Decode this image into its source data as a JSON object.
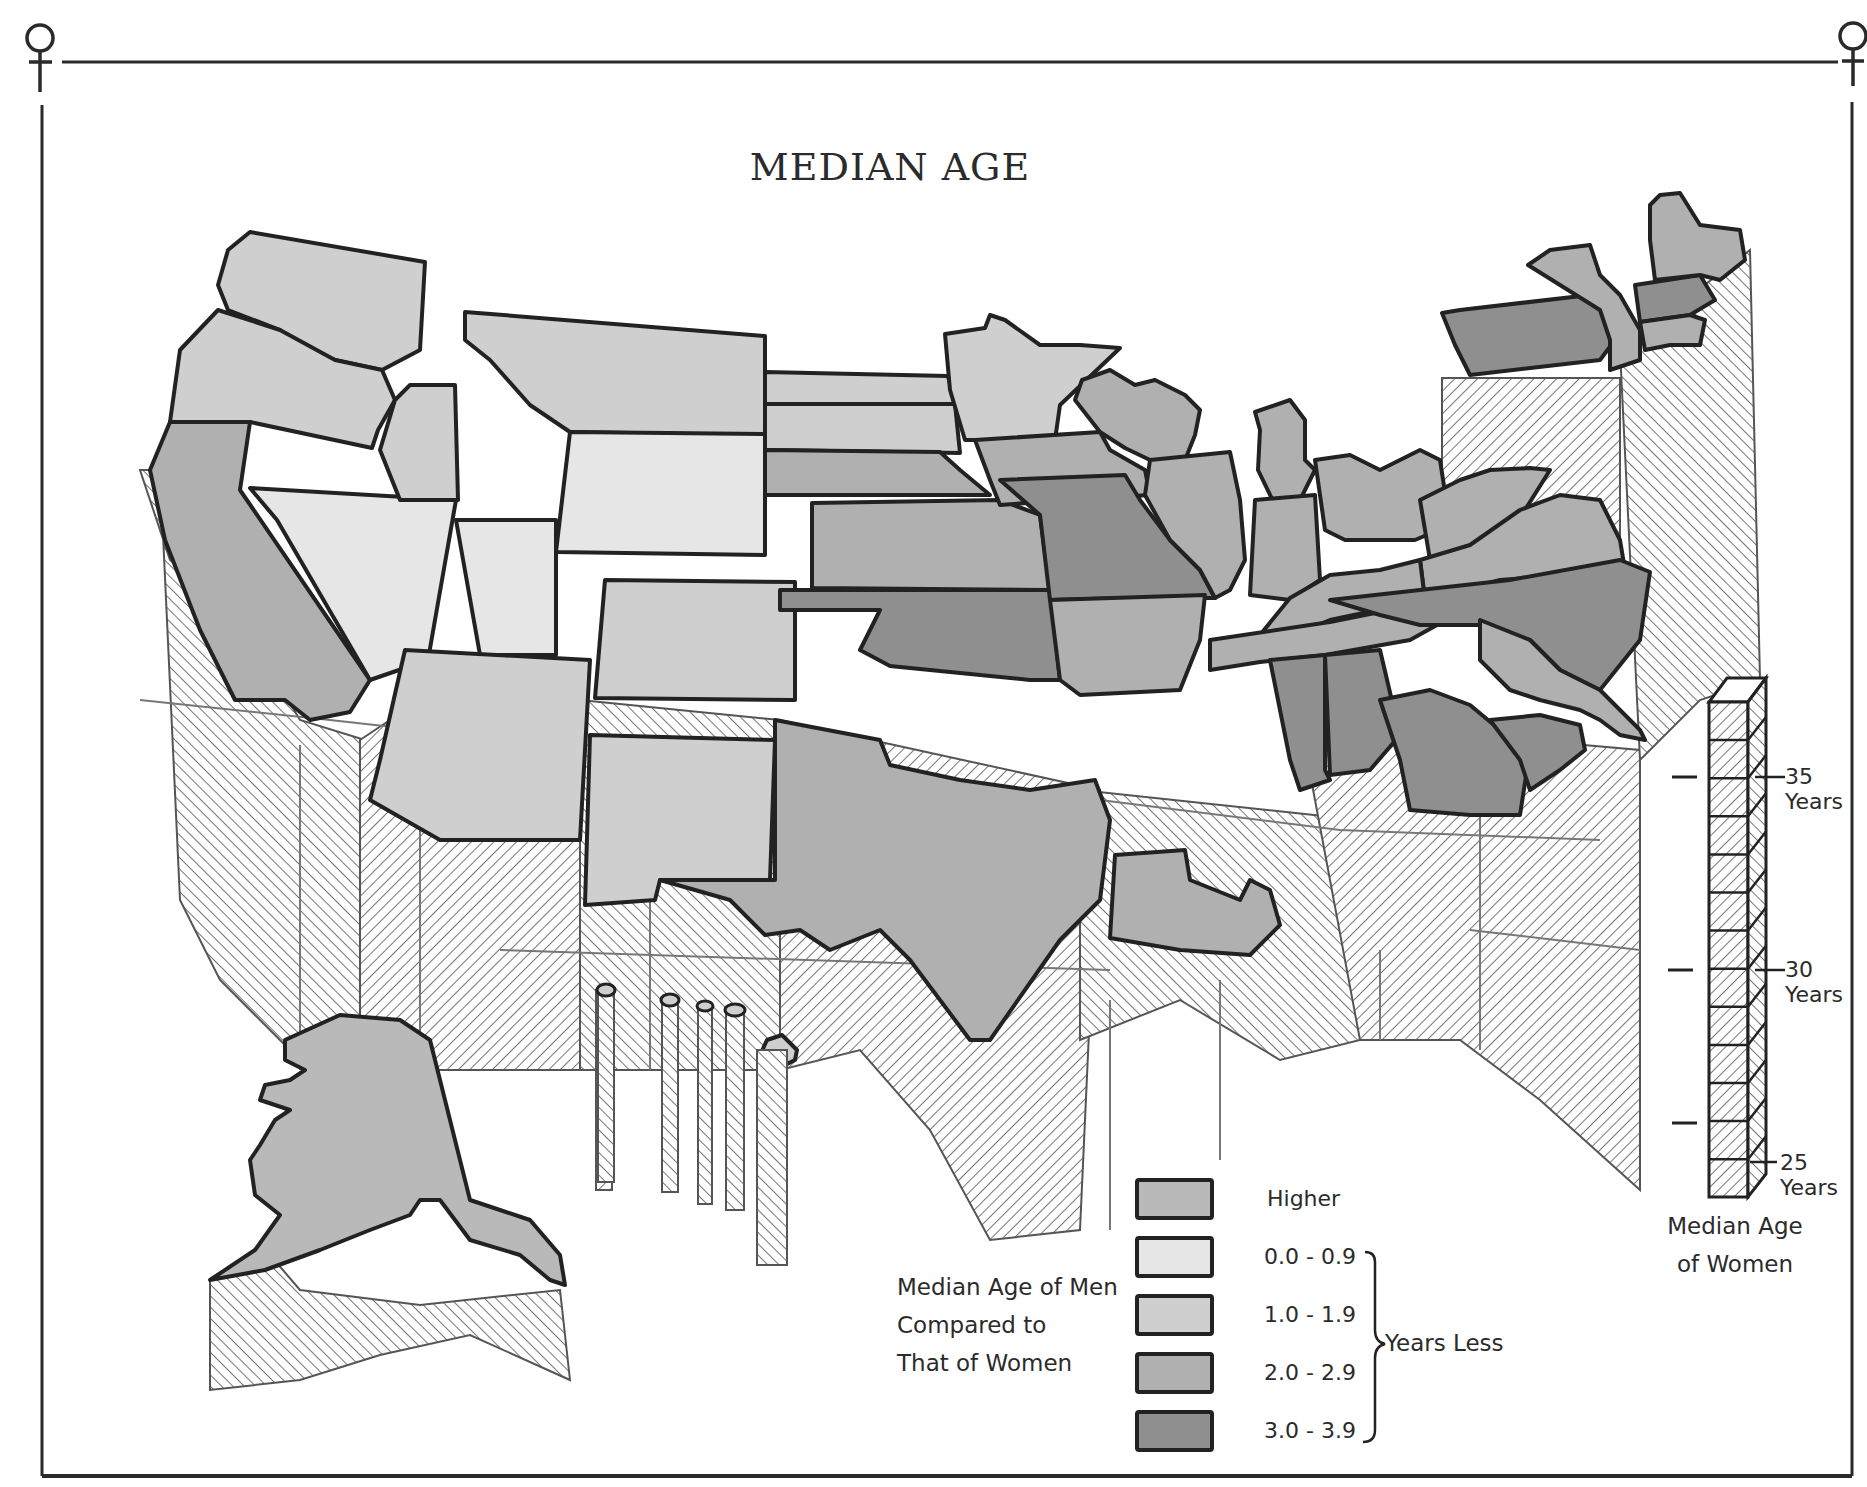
{
  "title": "MEDIAN AGE",
  "frame_symbol": "female-symbol",
  "colors": {
    "higher": "#b9b9b9",
    "range_0_0_9": "#e6e6e6",
    "range_1_0_1_9": "#cfcfcf",
    "range_2_0_2_9": "#b0b0b0",
    "range_3_0_3_9": "#8f8f8f",
    "outline": "#222222",
    "hatch": "#3a3a3a",
    "background": "#ffffff"
  },
  "legend": {
    "caption": [
      "Median Age of Men",
      "Compared to",
      "That of Women"
    ],
    "items": [
      {
        "label": "Higher",
        "key": "higher"
      },
      {
        "label": "0.0  -  0.9",
        "key": "range_0_0_9"
      },
      {
        "label": "1.0  -  1.9",
        "key": "range_1_0_1_9"
      },
      {
        "label": "2.0  -  2.9",
        "key": "range_2_0_2_9"
      },
      {
        "label": "3.0  -  3.9",
        "key": "range_3_0_3_9"
      }
    ],
    "bracket_label": "Years Less"
  },
  "scale": {
    "caption": [
      "Median Age",
      "of Women"
    ],
    "ticks": [
      {
        "value": "35",
        "unit": "Years"
      },
      {
        "value": "30",
        "unit": "Years"
      },
      {
        "value": "25",
        "unit": "Years"
      }
    ]
  },
  "chart_data": {
    "type": "map",
    "title": "MEDIAN AGE",
    "fill_legend_title": "Median Age of Men Compared to That of Women",
    "fill_categories": [
      "Higher",
      "0.0 - 0.9 Years Less",
      "1.0 - 1.9 Years Less",
      "2.0 - 2.9 Years Less",
      "3.0 - 3.9 Years Less"
    ],
    "height_legend_title": "Median Age of Women",
    "height_ticks": [
      25,
      30,
      35
    ],
    "height_unit": "Years",
    "states": [
      {
        "name": "Washington",
        "category": "1.0 - 1.9"
      },
      {
        "name": "Oregon",
        "category": "1.0 - 1.9"
      },
      {
        "name": "California",
        "category": "2.0 - 2.9"
      },
      {
        "name": "Nevada",
        "category": "0.0 - 0.9"
      },
      {
        "name": "Idaho",
        "category": "1.0 - 1.9"
      },
      {
        "name": "Montana",
        "category": "1.0 - 1.9"
      },
      {
        "name": "Wyoming",
        "category": "1.0 - 1.9"
      },
      {
        "name": "Utah",
        "category": "0.0 - 0.9"
      },
      {
        "name": "Colorado",
        "category": "1.0 - 1.9"
      },
      {
        "name": "Arizona",
        "category": "1.0 - 1.9"
      },
      {
        "name": "New Mexico",
        "category": "1.0 - 1.9"
      },
      {
        "name": "North Dakota",
        "category": "1.0 - 1.9"
      },
      {
        "name": "South Dakota",
        "category": "1.0 - 1.9"
      },
      {
        "name": "Nebraska",
        "category": "2.0 - 2.9"
      },
      {
        "name": "Kansas",
        "category": "2.0 - 2.9"
      },
      {
        "name": "Oklahoma",
        "category": "3.0 - 3.9"
      },
      {
        "name": "Texas",
        "category": "2.0 - 2.9"
      },
      {
        "name": "Minnesota",
        "category": "1.0 - 1.9"
      },
      {
        "name": "Iowa",
        "category": "2.0 - 2.9"
      },
      {
        "name": "Missouri",
        "category": "3.0 - 3.9"
      },
      {
        "name": "Arkansas",
        "category": "2.0 - 2.9"
      },
      {
        "name": "Louisiana",
        "category": "2.0 - 2.9"
      },
      {
        "name": "Wisconsin",
        "category": "2.0 - 2.9"
      },
      {
        "name": "Illinois",
        "category": "2.0 - 2.9"
      },
      {
        "name": "Michigan",
        "category": "2.0 - 2.9"
      },
      {
        "name": "Indiana",
        "category": "2.0 - 2.9"
      },
      {
        "name": "Ohio",
        "category": "2.0 - 2.9"
      },
      {
        "name": "Kentucky",
        "category": "2.0 - 2.9"
      },
      {
        "name": "Tennessee",
        "category": "2.0 - 2.9"
      },
      {
        "name": "Mississippi",
        "category": "3.0 - 3.9"
      },
      {
        "name": "Alabama",
        "category": "3.0 - 3.9"
      },
      {
        "name": "Georgia",
        "category": "3.0 - 3.9"
      },
      {
        "name": "Florida",
        "category": "2.0 - 2.9"
      },
      {
        "name": "South Carolina",
        "category": "3.0 - 3.9"
      },
      {
        "name": "North Carolina",
        "category": "3.0 - 3.9"
      },
      {
        "name": "Virginia",
        "category": "2.0 - 2.9"
      },
      {
        "name": "West Virginia",
        "category": "2.0 - 2.9"
      },
      {
        "name": "Pennsylvania",
        "category": "3.0 - 3.9"
      },
      {
        "name": "New York",
        "category": "2.0 - 2.9"
      },
      {
        "name": "New England",
        "category": "2.0 - 2.9"
      },
      {
        "name": "Maine",
        "category": "2.0 - 2.9"
      },
      {
        "name": "Alaska",
        "category": "Higher"
      },
      {
        "name": "Hawaii",
        "category": "1.0 - 1.9"
      }
    ]
  },
  "map": {
    "prism_sides": [
      {
        "name": "west-coast-sides",
        "points": "140,470 160,470 180,900 220,980 290,1050 360,1070 365,740 300,720 240,620 170,560"
      },
      {
        "name": "mountain-sides",
        "points": "360,740 420,700 580,700 580,1070 360,1070"
      },
      {
        "name": "southwest-sides",
        "points": "580,700 780,720 780,1070 580,1070"
      },
      {
        "name": "plains-south-sides",
        "points": "780,720 1100,790 1080,1230 990,1240 930,1130 860,1050 780,1070"
      },
      {
        "name": "south-central-sides",
        "points": "1080,790 1360,820 1360,1040 1280,1060 1180,1000 1080,1040"
      },
      {
        "name": "southeast-sides",
        "points": "1300,720 1640,750 1640,1190 1540,1100 1460,1040 1360,1040"
      },
      {
        "name": "atlantic-sides",
        "points": "1620,350 1750,250 1760,680 1700,700 1640,760"
      },
      {
        "name": "northeast-front-sides",
        "points": "1442,378 1620,378 1620,560 1442,560"
      },
      {
        "name": "alaska-sides",
        "points": "210,1280 270,1255 300,1290 420,1305 560,1290 570,1380 470,1335 380,1355 300,1380 210,1390"
      },
      {
        "name": "hawaii-sides",
        "points": "596,990 612,990 612,1190 596,1190"
      }
    ],
    "states": [
      {
        "name": "washington",
        "key": "range_1_0_1_9",
        "points": "228,250 250,232 425,262 420,350 382,370 335,360 300,348 280,330 228,310 218,285"
      },
      {
        "name": "oregon",
        "key": "range_1_0_1_9",
        "points": "218,310 280,330 335,360 382,370 395,400 378,430 372,448 250,422 170,422 180,350"
      },
      {
        "name": "california",
        "key": "range_2_0_2_9",
        "points": "170,422 250,422 240,490 370,680 350,712 310,720 285,700 235,700 200,630 165,540 150,470"
      },
      {
        "name": "nevada",
        "key": "range_0_0_9",
        "points": "250,488 456,500 428,660 370,680 277,520"
      },
      {
        "name": "idaho",
        "key": "range_1_0_1_9",
        "points": "395,400 410,385 455,385 458,500 400,500 380,450"
      },
      {
        "name": "montana",
        "key": "range_1_0_1_9",
        "points": "465,312 765,336 765,434 690,434 570,432 530,405 490,360 465,340"
      },
      {
        "name": "wyoming",
        "key": "range_0_0_9",
        "points": "570,432 765,434 765,555 556,552"
      },
      {
        "name": "utah",
        "key": "range_0_0_9",
        "points": "456,520 556,520 556,655 480,655"
      },
      {
        "name": "colorado",
        "key": "range_1_0_1_9",
        "points": "605,580 795,582 795,700 595,698"
      },
      {
        "name": "arizona",
        "key": "range_1_0_1_9",
        "points": "405,650 590,660 580,840 440,840 370,800 380,760"
      },
      {
        "name": "new-mexico",
        "key": "range_1_0_1_9",
        "points": "590,735 775,740 770,880 660,880 655,900 585,905"
      },
      {
        "name": "north-dakota",
        "key": "range_1_0_1_9",
        "points": "765,372 948,376 955,404 765,404"
      },
      {
        "name": "south-dakota",
        "key": "range_1_0_1_9",
        "points": "765,404 955,404 960,453 765,450"
      },
      {
        "name": "nebraska",
        "key": "range_2_0_2_9",
        "points": "765,450 940,452 960,470 990,495 765,495"
      },
      {
        "name": "kansas",
        "key": "range_2_0_2_9",
        "points": "812,503 1000,500 1040,515 1050,590 812,588"
      },
      {
        "name": "oklahoma",
        "key": "range_3_0_3_9",
        "points": "780,590 1050,590 1060,680 1030,680 950,672 890,666 860,650 880,610 780,610"
      },
      {
        "name": "texas",
        "key": "range_2_0_2_9",
        "points": "775,720 880,740 890,765 960,780 1030,790 1095,780 1110,820 1100,900 1060,940 990,1040 970,1040 910,960 880,930 830,950 800,930 765,935 730,900 660,880 775,880"
      },
      {
        "name": "minnesota",
        "key": "range_1_0_1_9",
        "points": "945,334 985,328 990,315 1005,320 1040,345 1080,345 1120,348 1060,405 1055,440 965,440 950,390"
      },
      {
        "name": "iowa",
        "key": "range_2_0_2_9",
        "points": "975,440 1100,432 1110,450 1145,470 1150,495 1070,500 1000,505 990,480"
      },
      {
        "name": "missouri",
        "key": "range_3_0_3_9",
        "points": "1000,480 1125,475 1140,500 1170,540 1200,570 1215,598 1125,598 1050,600 1040,515"
      },
      {
        "name": "arkansas",
        "key": "range_2_0_2_9",
        "points": "1050,600 1205,595 1200,640 1180,690 1080,695 1060,680"
      },
      {
        "name": "louisiana",
        "key": "range_2_0_2_9",
        "points": "1115,855 1185,850 1190,880 1240,900 1250,880 1270,890 1280,925 1250,955 1180,950 1110,938"
      },
      {
        "name": "wisconsin",
        "key": "range_2_0_2_9",
        "points": "1082,380 1110,370 1135,385 1155,380 1185,395 1200,410 1195,435 1185,460 1150,460 1125,448 1100,432 1075,400"
      },
      {
        "name": "illinois",
        "key": "range_2_0_2_9",
        "points": "1150,460 1230,452 1240,500 1245,560 1230,590 1215,598 1200,570 1170,540 1145,495"
      },
      {
        "name": "michigan",
        "key": "range_2_0_2_9",
        "points": "1255,412 1290,400 1305,420 1305,460 1315,470 1300,500 1275,505 1258,470 1260,430"
      },
      {
        "name": "indiana",
        "key": "range_2_0_2_9",
        "points": "1255,500 1315,495 1320,580 1290,600 1250,595"
      },
      {
        "name": "ohio",
        "key": "range_2_0_2_9",
        "points": "1315,460 1350,455 1380,470 1400,460 1420,450 1440,460 1450,525 1415,540 1345,540 1325,530"
      },
      {
        "name": "west-virginia",
        "key": "range_2_0_2_9",
        "points": "1420,500 1460,480 1490,470 1530,468 1550,470 1525,510 1470,550 1430,560 1425,530"
      },
      {
        "name": "virginia",
        "key": "range_2_0_2_9",
        "points": "1420,560 1470,545 1520,510 1560,495 1600,500 1620,540 1625,570 1500,580 1425,600"
      },
      {
        "name": "kentucky",
        "key": "range_2_0_2_9",
        "points": "1290,598 1330,575 1380,570 1420,560 1425,600 1330,620 1300,632 1260,635"
      },
      {
        "name": "tennessee",
        "key": "range_2_0_2_9",
        "points": "1210,640 1330,622 1420,604 1500,590 1410,640 1325,655 1260,662 1210,670"
      },
      {
        "name": "north-carolina",
        "key": "range_3_0_3_9",
        "points": "1330,600 1420,590 1510,580 1620,560 1650,572 1640,640 1600,690 1560,670 1530,640 1480,625 1420,625 1380,615"
      },
      {
        "name": "mississippi",
        "key": "range_3_0_3_9",
        "points": "1270,660 1325,655 1325,770 1330,780 1300,790 1290,760"
      },
      {
        "name": "alabama",
        "key": "range_3_0_3_9",
        "points": "1325,655 1380,650 1400,735 1370,770 1330,775"
      },
      {
        "name": "georgia",
        "key": "range_3_0_3_9",
        "points": "1380,700 1430,690 1470,705 1500,730 1530,750 1520,815 1470,815 1410,810 1400,760"
      },
      {
        "name": "south-carolina",
        "key": "range_3_0_3_9",
        "points": "1490,720 1540,715 1580,725 1585,750 1560,770 1530,790 1520,760"
      },
      {
        "name": "florida",
        "key": "range_2_0_2_9",
        "points": "1480,620 1530,640 1560,670 1600,690 1620,710 1640,730 1645,740 1620,735 1600,720 1580,710 1540,700 1510,690 1480,660"
      },
      {
        "name": "pennsylvania",
        "key": "range_3_0_3_9",
        "points": "1442,313 1460,310 1590,295 1610,300 1615,340 1600,360 1470,375 1455,345"
      },
      {
        "name": "new-york",
        "key": "range_2_0_2_9",
        "points": "1528,265 1550,250 1590,245 1600,275 1620,295 1640,330 1640,360 1610,370 1610,340 1600,310"
      },
      {
        "name": "new-england",
        "key": "range_3_0_3_9",
        "points": "1635,285 1700,275 1715,300 1690,315 1640,322"
      },
      {
        "name": "new-england-south",
        "key": "range_2_0_2_9",
        "points": "1640,322 1690,315 1705,320 1700,345 1670,345 1645,350"
      },
      {
        "name": "maine",
        "key": "range_2_0_2_9",
        "points": "1650,205 1660,195 1680,193 1700,225 1740,230 1745,260 1720,280 1700,275 1655,280 1650,240"
      },
      {
        "name": "alaska",
        "key": "higher",
        "points": "285,1040 340,1015 400,1020 430,1040 460,1160 470,1200 500,1210 530,1220 560,1255 565,1285 550,1280 520,1255 470,1240 440,1200 420,1200 410,1215 370,1230 320,1250 265,1270 210,1280 255,1250 280,1215 255,1195 250,1160 260,1145 275,1120 290,1110 260,1100 265,1085 290,1080 305,1070 285,1060"
      },
      {
        "name": "hawaii-big-island",
        "key": "range_1_0_1_9",
        "points": "767,1040 782,1035 797,1050 795,1060 785,1065 777,1080 770,1065 760,1055"
      }
    ],
    "inner_lines": [
      "140,700 330,720 510,740 580,760",
      "500,950 1110,970",
      "1100,800 1340,830 1600,840",
      "1470,930 1640,950",
      "300,745 300,1070",
      "420,800 420,1070",
      "650,880 650,1070",
      "1110,1000 1110,1230",
      "1220,980 1220,1160",
      "1380,950 1380,1040",
      "1480,815 1480,1050"
    ]
  }
}
